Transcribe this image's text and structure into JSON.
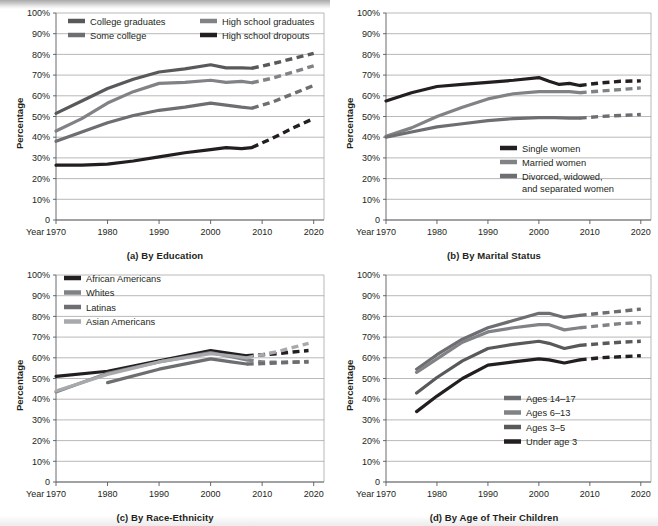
{
  "figure": {
    "y_axis_label": "Percentage",
    "x_axis_prefix": "Year",
    "y_ticks": [
      "100%",
      "90%",
      "80%",
      "70%",
      "60%",
      "50%",
      "40%",
      "30%",
      "20%",
      "10%",
      "0"
    ],
    "x_ticks": [
      "1970",
      "1980",
      "1990",
      "2000",
      "2010",
      "2020"
    ],
    "colors": {
      "black": "#231f20",
      "dark_gray": "#58595b",
      "mid_gray": "#808285",
      "light_gray": "#a7a9ac",
      "gridline": "#9b9b9b"
    }
  },
  "chart_data": [
    {
      "type": "line",
      "id": "a",
      "title": "(a) By Education",
      "xlabel": "Year",
      "ylabel": "Percentage",
      "xlim": [
        1970,
        2022
      ],
      "ylim": [
        0,
        100
      ],
      "ytick_values": [
        0,
        10,
        20,
        30,
        40,
        50,
        60,
        70,
        80,
        90,
        100
      ],
      "xtick_values": [
        1970,
        1980,
        1990,
        2000,
        2010,
        2020
      ],
      "grid": true,
      "legend_position": "top-inside",
      "series": [
        {
          "name": "College graduates",
          "color": "#58595b",
          "x": [
            1970,
            1975,
            1980,
            1985,
            1990,
            1995,
            2000,
            2003,
            2006,
            2008
          ],
          "values": [
            51.5,
            57.5,
            63.5,
            68.0,
            71.5,
            73.0,
            75.0,
            73.5,
            73.5,
            73.3
          ],
          "projected_x": [
            2008,
            2012,
            2016,
            2020
          ],
          "projected_values": [
            73.3,
            75.5,
            78.0,
            80.5
          ]
        },
        {
          "name": "High school graduates",
          "color": "#808285",
          "x": [
            1970,
            1975,
            1980,
            1985,
            1990,
            1995,
            2000,
            2003,
            2006,
            2008
          ],
          "values": [
            43.0,
            49.0,
            56.5,
            62.0,
            66.0,
            66.5,
            67.5,
            66.5,
            67.0,
            66.3
          ],
          "projected_x": [
            2008,
            2012,
            2016,
            2020
          ],
          "projected_values": [
            66.3,
            68.5,
            71.5,
            74.5
          ]
        },
        {
          "name": "Some college",
          "color": "#6d6e71",
          "x": [
            1970,
            1975,
            1980,
            1985,
            1990,
            1995,
            2000,
            2003,
            2006,
            2008
          ],
          "values": [
            38.0,
            42.5,
            47.0,
            50.5,
            53.0,
            54.5,
            56.5,
            55.5,
            54.5,
            54.0
          ],
          "projected_x": [
            2008,
            2012,
            2016,
            2020
          ],
          "projected_values": [
            54.0,
            57.0,
            61.0,
            65.0
          ]
        },
        {
          "name": "High school dropouts",
          "color": "#231f20",
          "x": [
            1970,
            1975,
            1980,
            1985,
            1990,
            1995,
            2000,
            2003,
            2006,
            2008
          ],
          "values": [
            26.5,
            26.5,
            27.0,
            28.5,
            30.5,
            32.5,
            34.0,
            35.0,
            34.5,
            35.0
          ],
          "projected_x": [
            2008,
            2012,
            2016,
            2020
          ],
          "projected_values": [
            35.0,
            39.5,
            44.5,
            49.0
          ]
        }
      ]
    },
    {
      "type": "line",
      "id": "b",
      "title": "(b) By Marital Status",
      "xlabel": "Year",
      "ylabel": "Percentage",
      "xlim": [
        1970,
        2022
      ],
      "ylim": [
        0,
        100
      ],
      "ytick_values": [
        0,
        10,
        20,
        30,
        40,
        50,
        60,
        70,
        80,
        90,
        100
      ],
      "xtick_values": [
        1970,
        1980,
        1990,
        2000,
        2010,
        2020
      ],
      "grid": true,
      "legend_position": "bottom-right-inside",
      "series": [
        {
          "name": "Single women",
          "color": "#231f20",
          "x": [
            1970,
            1975,
            1980,
            1985,
            1990,
            1995,
            2000,
            2002,
            2004,
            2006,
            2008
          ],
          "values": [
            57.5,
            61.5,
            64.5,
            65.5,
            66.5,
            67.5,
            68.8,
            67.0,
            65.5,
            66.0,
            65.0
          ],
          "projected_x": [
            2008,
            2012,
            2016,
            2020
          ],
          "projected_values": [
            65.0,
            66.2,
            67.0,
            67.2
          ]
        },
        {
          "name": "Married women",
          "color": "#808285",
          "x": [
            1970,
            1975,
            1980,
            1985,
            1990,
            1995,
            2000,
            2003,
            2006,
            2008
          ],
          "values": [
            40.5,
            44.5,
            50.0,
            54.5,
            58.5,
            61.0,
            62.0,
            62.0,
            62.0,
            61.5
          ],
          "projected_x": [
            2008,
            2012,
            2016,
            2020
          ],
          "projected_values": [
            61.5,
            62.3,
            63.0,
            63.8
          ]
        },
        {
          "name": "Divorced, widowed, and separated women",
          "color": "#6d6e71",
          "x": [
            1970,
            1975,
            1980,
            1985,
            1990,
            1995,
            2000,
            2003,
            2006,
            2008
          ],
          "values": [
            40.0,
            42.5,
            45.0,
            46.5,
            48.0,
            49.0,
            49.5,
            49.5,
            49.2,
            49.2
          ],
          "projected_x": [
            2008,
            2012,
            2016,
            2020
          ],
          "projected_values": [
            49.2,
            50.0,
            50.5,
            51.0
          ]
        }
      ]
    },
    {
      "type": "line",
      "id": "c",
      "title": "(c) By Race-Ethnicity",
      "xlabel": "Year",
      "ylabel": "Percentage",
      "xlim": [
        1970,
        2022
      ],
      "ylim": [
        0,
        100
      ],
      "ytick_values": [
        0,
        10,
        20,
        30,
        40,
        50,
        60,
        70,
        80,
        90,
        100
      ],
      "xtick_values": [
        1970,
        1980,
        1990,
        2000,
        2010,
        2020
      ],
      "grid": true,
      "legend_position": "top-left-inside",
      "series": [
        {
          "name": "African Americans",
          "color": "#231f20",
          "x": [
            1970,
            1980,
            1990,
            2000,
            2004,
            2007
          ],
          "values": [
            51.0,
            53.5,
            58.5,
            63.5,
            62.0,
            61.0
          ],
          "projected_x": [
            2007,
            2010,
            2013,
            2016,
            2019
          ],
          "projected_values": [
            61.0,
            61.5,
            62.0,
            62.8,
            63.5
          ]
        },
        {
          "name": "Whites",
          "color": "#808285",
          "x": [
            1970,
            1980,
            1990,
            2000,
            2004,
            2007
          ],
          "values": [
            43.5,
            52.5,
            58.0,
            62.5,
            60.5,
            59.0
          ],
          "projected_x": [
            2007,
            2010,
            2013,
            2016,
            2019
          ],
          "projected_values": [
            59.0,
            58.0,
            57.8,
            58.0,
            58.2
          ]
        },
        {
          "name": "Latinas",
          "color": "#6d6e71",
          "x": [
            1980,
            1990,
            2000,
            2004,
            2007
          ],
          "values": [
            48.0,
            54.5,
            59.5,
            58.0,
            57.0
          ],
          "projected_x": [
            2007,
            2010,
            2013,
            2016,
            2019
          ],
          "projected_values": [
            57.0,
            57.2,
            57.5,
            57.8,
            58.0
          ]
        },
        {
          "name": "Asian Americans",
          "color": "#a7a9ac",
          "x": [
            1970,
            1980,
            1990,
            2000,
            2004,
            2007
          ],
          "values": [
            44.0,
            52.0,
            58.0,
            62.0,
            61.0,
            60.0
          ],
          "projected_x": [
            2007,
            2010,
            2013,
            2016,
            2019
          ],
          "projected_values": [
            60.0,
            61.5,
            63.0,
            65.0,
            67.0
          ]
        }
      ]
    },
    {
      "type": "line",
      "id": "d",
      "title": "(d) By Age of Their Children",
      "xlabel": "Year",
      "ylabel": "Percentage",
      "xlim": [
        1970,
        2022
      ],
      "ylim": [
        0,
        100
      ],
      "ytick_values": [
        0,
        10,
        20,
        30,
        40,
        50,
        60,
        70,
        80,
        90,
        100
      ],
      "xtick_values": [
        1970,
        1980,
        1990,
        2000,
        2010,
        2020
      ],
      "grid": true,
      "legend_position": "bottom-right-inside",
      "series": [
        {
          "name": "Ages 14–17",
          "color": "#6d6e71",
          "x": [
            1976,
            1980,
            1985,
            1990,
            1995,
            2000,
            2002,
            2005,
            2008
          ],
          "values": [
            54.5,
            61.5,
            69.0,
            74.5,
            78.0,
            81.5,
            81.5,
            79.5,
            80.5
          ],
          "projected_x": [
            2008,
            2012,
            2016,
            2020
          ],
          "projected_values": [
            80.5,
            81.5,
            82.5,
            83.5
          ]
        },
        {
          "name": "Ages 6–13",
          "color": "#808285",
          "x": [
            1976,
            1980,
            1985,
            1990,
            1995,
            2000,
            2002,
            2005,
            2008
          ],
          "values": [
            53.0,
            59.5,
            67.5,
            72.5,
            74.5,
            76.0,
            76.0,
            73.5,
            74.5
          ],
          "projected_x": [
            2008,
            2012,
            2016,
            2020
          ],
          "projected_values": [
            74.5,
            75.5,
            76.5,
            77.0
          ]
        },
        {
          "name": "Ages 3–5",
          "color": "#58595b",
          "x": [
            1976,
            1980,
            1985,
            1990,
            1995,
            2000,
            2002,
            2005,
            2008
          ],
          "values": [
            43.0,
            50.5,
            58.5,
            64.5,
            66.5,
            68.0,
            67.0,
            64.5,
            66.0
          ],
          "projected_x": [
            2008,
            2012,
            2016,
            2020
          ],
          "projected_values": [
            66.0,
            66.8,
            67.5,
            68.0
          ]
        },
        {
          "name": "Under age 3",
          "color": "#231f20",
          "x": [
            1976,
            1980,
            1985,
            1990,
            1995,
            2000,
            2002,
            2005,
            2008
          ],
          "values": [
            34.0,
            41.5,
            50.0,
            56.5,
            58.0,
            59.5,
            59.0,
            57.5,
            59.0
          ],
          "projected_x": [
            2008,
            2012,
            2016,
            2020
          ],
          "projected_values": [
            59.0,
            60.0,
            60.5,
            61.0
          ]
        }
      ]
    }
  ]
}
